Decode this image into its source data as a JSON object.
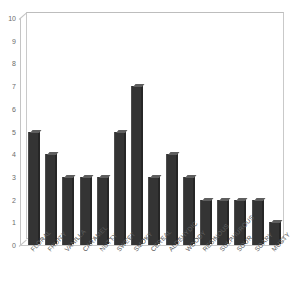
{
  "chart_data": {
    "type": "bar",
    "title": "",
    "xlabel": "",
    "ylabel": "",
    "ylim": [
      0,
      10
    ],
    "yticks": [
      0,
      1,
      2,
      3,
      4,
      5,
      6,
      7,
      8,
      9,
      10
    ],
    "grid": false,
    "legend": null,
    "categories": [
      "FLORAL",
      "FRUITY",
      "VANILLA",
      "CARAMEL",
      "NUTTY",
      "SWEET",
      "SMOKY",
      "CEREAL",
      "ALDEHYDIC",
      "WOODY",
      "RESINOUS",
      "SULPHUROUS",
      "SOUR",
      "SOAPY",
      "MUSTY"
    ],
    "values": [
      5,
      4,
      3,
      3,
      3,
      5,
      7,
      3,
      4,
      3,
      2,
      2,
      2,
      2,
      1
    ],
    "bar_color": "#343434",
    "bar_top_color": "#5e5e5e",
    "bar_side_color": "#262626",
    "axis_color": "#c4c4c4",
    "tick_label_color": "#6b6b6b",
    "background": "#ffffff",
    "style": "3d-column"
  }
}
